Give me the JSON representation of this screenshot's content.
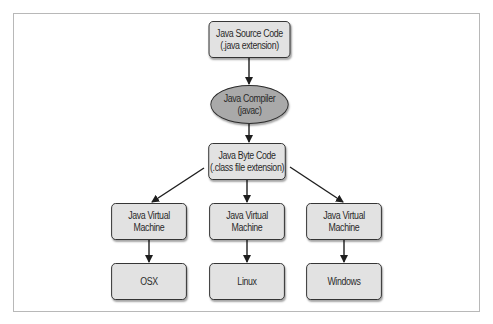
{
  "diagram": {
    "nodes": {
      "source": {
        "line1": "Java Source Code",
        "line2": "(.java extension)"
      },
      "compiler": {
        "line1": "Java Compiler",
        "line2": "(javac)"
      },
      "bytecode": {
        "line1": "Java Byte Code",
        "line2": "(.class file extension)"
      },
      "jvm_left": {
        "line1": "Java Virtual",
        "line2": "Machine"
      },
      "jvm_middle": {
        "line1": "Java Virtual",
        "line2": "Machine"
      },
      "jvm_right": {
        "line1": "Java Virtual",
        "line2": "Machine"
      },
      "os_left": {
        "label": "OSX"
      },
      "os_middle": {
        "label": "Linux"
      },
      "os_right": {
        "label": "Windows"
      }
    },
    "edges": [
      [
        "source",
        "compiler"
      ],
      [
        "compiler",
        "bytecode"
      ],
      [
        "bytecode",
        "jvm_left"
      ],
      [
        "bytecode",
        "jvm_middle"
      ],
      [
        "bytecode",
        "jvm_right"
      ],
      [
        "jvm_left",
        "os_left"
      ],
      [
        "jvm_middle",
        "os_middle"
      ],
      [
        "jvm_right",
        "os_right"
      ]
    ],
    "colors": {
      "box_fill": "#e2e2e2",
      "ellipse_fill": "#a9a9a9",
      "stroke": "#2a2a2a",
      "frame": "#b8b8b8"
    }
  }
}
